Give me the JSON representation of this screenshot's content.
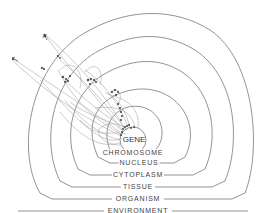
{
  "diagram": {
    "title": "",
    "type": "nested-hierarchy",
    "levels": [
      {
        "id": "gene",
        "label": "GENE"
      },
      {
        "id": "chromosome",
        "label": "CHROMOSOME"
      },
      {
        "id": "nucleus",
        "label": "NUCLEUS"
      },
      {
        "id": "cytoplasm",
        "label": "CYTOPLASM"
      },
      {
        "id": "tissue",
        "label": "TISSUE"
      },
      {
        "id": "organism",
        "label": "ORGANISM"
      },
      {
        "id": "environment",
        "label": "ENVIRONMENT"
      }
    ],
    "line_color": "#6f6f6f",
    "text_color": "#444444",
    "background": "#ffffff"
  }
}
